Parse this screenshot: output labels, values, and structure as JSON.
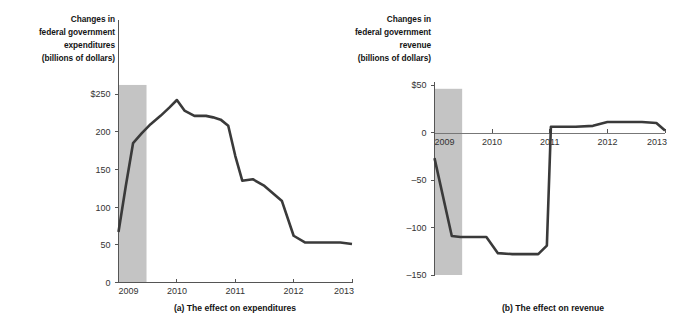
{
  "figure": {
    "width": 676,
    "height": 331,
    "background": "#ffffff",
    "line_color": "#3a3a3a",
    "recession_color": "#c4c4c4",
    "axis_color": "#555555"
  },
  "chart_data": [
    {
      "id": "panel-a",
      "type": "line",
      "title": "",
      "caption": "(a) The effect on expenditures",
      "ylabel_lines": [
        "Changes in",
        "federal government",
        "expenditures",
        "(billions of dollars)"
      ],
      "xlabel": "",
      "ylabel": "Changes in federal government expenditures (billions of dollars)",
      "ytick_labels": [
        "$250",
        "200",
        "150",
        "100",
        "50",
        "0"
      ],
      "ytick_values": [
        250,
        200,
        150,
        100,
        50,
        0
      ],
      "xtick_labels": [
        "2009",
        "2010",
        "2011",
        "2012",
        "2013"
      ],
      "xtick_values": [
        2009,
        2010,
        2011,
        2012,
        2013
      ],
      "ylim": [
        0,
        262
      ],
      "xlim": [
        2009,
        2013
      ],
      "grid": false,
      "legend": "none",
      "shaded_region": {
        "label": "recession",
        "x_start": 2009.0,
        "x_end": 2009.48,
        "y_start": 0,
        "y_end": 262
      },
      "x": [
        2009.0,
        2009.125,
        2009.25,
        2009.4,
        2009.55,
        2009.72,
        2009.87,
        2010.0,
        2010.13,
        2010.3,
        2010.5,
        2010.62,
        2010.75,
        2010.88,
        2011.0,
        2011.12,
        2011.3,
        2011.5,
        2011.65,
        2011.8,
        2012.0,
        2012.2,
        2012.5,
        2012.8,
        2013.0
      ],
      "y": [
        67,
        128,
        185,
        198,
        210,
        221,
        232,
        242,
        228,
        221,
        221,
        219,
        216,
        208,
        168,
        135,
        137,
        128,
        118,
        108,
        62,
        53,
        53,
        53,
        51
      ],
      "series": [
        {
          "name": "Changes in federal government expenditures",
          "values": [
            67,
            128,
            185,
            198,
            210,
            221,
            232,
            242,
            228,
            221,
            221,
            219,
            216,
            208,
            168,
            135,
            137,
            128,
            118,
            108,
            62,
            53,
            53,
            53,
            51
          ]
        }
      ]
    },
    {
      "id": "panel-b",
      "type": "line",
      "title": "",
      "caption": "(b) The effect on revenue",
      "ylabel_lines": [
        "Changes in",
        "federal government",
        "revenue",
        "(billions of dollars)"
      ],
      "xlabel": "",
      "ylabel": "Changes in federal government revenue (billions of dollars)",
      "ytick_labels": [
        "$50",
        "0",
        "-50",
        "-100",
        "-150"
      ],
      "ytick_values": [
        50,
        0,
        -50,
        -100,
        -150
      ],
      "xtick_labels": [
        "2009",
        "2010",
        "2011",
        "2012",
        "2013"
      ],
      "xtick_values": [
        2009,
        2010,
        2011,
        2012,
        2013
      ],
      "ylim": [
        -150,
        50
      ],
      "xlim": [
        2009,
        2013
      ],
      "grid": false,
      "legend": "none",
      "shaded_region": {
        "label": "recession",
        "x_start": 2009.0,
        "x_end": 2009.48,
        "y_start": -150,
        "y_end": 46
      },
      "x": [
        2009.0,
        2009.3,
        2009.45,
        2009.75,
        2009.9,
        2010.1,
        2010.35,
        2010.8,
        2010.95,
        2011.02,
        2011.45,
        2011.75,
        2012.0,
        2012.6,
        2012.85,
        2013.0
      ],
      "y": [
        -27,
        -109,
        -110,
        -110,
        -110,
        -127,
        -128,
        -128,
        -119,
        6,
        6,
        7,
        11,
        11,
        10,
        2
      ],
      "series": [
        {
          "name": "Changes in federal government revenue",
          "values": [
            -27,
            -109,
            -110,
            -110,
            -110,
            -127,
            -128,
            -128,
            -119,
            6,
            6,
            7,
            11,
            11,
            10,
            2
          ]
        }
      ]
    }
  ]
}
